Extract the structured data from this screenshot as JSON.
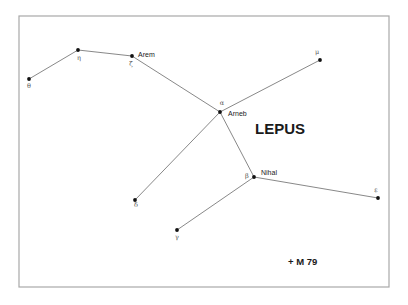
{
  "chart_data": {
    "type": "diagram",
    "title": "LEPUS",
    "frame": {
      "x": 19,
      "y": 16,
      "width": 370,
      "height": 271,
      "color": "#a8a8a8"
    },
    "stars": [
      {
        "id": "theta",
        "greek": "θ",
        "name": "",
        "x": 29,
        "y": 79,
        "glabel": {
          "x": 29,
          "y": 88,
          "anchor": "middle"
        }
      },
      {
        "id": "eta",
        "greek": "η",
        "name": "",
        "x": 78,
        "y": 50,
        "glabel": {
          "x": 79,
          "y": 60,
          "anchor": "middle"
        }
      },
      {
        "id": "zeta",
        "greek": "ζ",
        "name": "Arem",
        "x": 132,
        "y": 56,
        "glabel": {
          "x": 131,
          "y": 66,
          "anchor": "middle"
        },
        "nlabel": {
          "x": 138,
          "y": 57
        }
      },
      {
        "id": "alpha",
        "greek": "α",
        "name": "Arneb",
        "x": 220,
        "y": 112,
        "glabel": {
          "x": 222,
          "y": 105,
          "anchor": "middle"
        },
        "nlabel": {
          "x": 228,
          "y": 116
        }
      },
      {
        "id": "mu",
        "greek": "μ",
        "name": "",
        "x": 320,
        "y": 60,
        "glabel": {
          "x": 317,
          "y": 54,
          "anchor": "middle"
        }
      },
      {
        "id": "beta",
        "greek": "β",
        "name": "Nihal",
        "x": 254,
        "y": 177,
        "glabel": {
          "x": 247,
          "y": 178,
          "anchor": "middle"
        },
        "nlabel": {
          "x": 261,
          "y": 175
        }
      },
      {
        "id": "epsilon",
        "greek": "ε",
        "name": "",
        "x": 378,
        "y": 198,
        "glabel": {
          "x": 376,
          "y": 192,
          "anchor": "middle"
        }
      },
      {
        "id": "delta",
        "greek": "δ",
        "name": "",
        "x": 135,
        "y": 200,
        "glabel": {
          "x": 136,
          "y": 207,
          "anchor": "middle"
        }
      },
      {
        "id": "gamma",
        "greek": "γ",
        "name": "",
        "x": 177,
        "y": 230,
        "glabel": {
          "x": 177,
          "y": 239,
          "anchor": "middle"
        }
      }
    ],
    "lines": [
      [
        "theta",
        "eta"
      ],
      [
        "eta",
        "zeta"
      ],
      [
        "zeta",
        "alpha"
      ],
      [
        "alpha",
        "mu"
      ],
      [
        "alpha",
        "delta"
      ],
      [
        "alpha",
        "beta"
      ],
      [
        "beta",
        "epsilon"
      ],
      [
        "beta",
        "gamma"
      ]
    ],
    "deep_sky_objects": [
      {
        "marker": "+",
        "label": "M 79",
        "x": 288,
        "y": 262
      }
    ],
    "title_position": {
      "x": 255,
      "y": 134
    }
  }
}
